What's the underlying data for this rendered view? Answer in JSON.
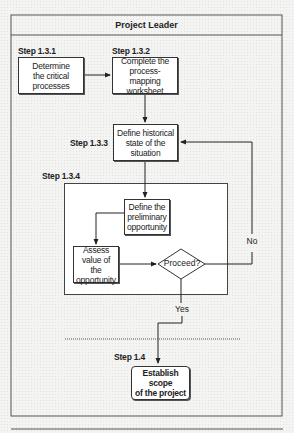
{
  "header": {
    "title": "Project Leader"
  },
  "steps": [
    {
      "id": "step-1-3-1",
      "label": "Step 1.3.1",
      "text": "Determine the critical processes",
      "lines": [
        "Determine",
        "the critical",
        "processes"
      ]
    },
    {
      "id": "step-1-3-2",
      "label": "Step 1.3.2",
      "text": "Complete the process-mapping worksheet",
      "lines": [
        "Complete the",
        "process-mapping",
        "worksheet"
      ]
    },
    {
      "id": "step-1-3-3",
      "label": "Step 1.3.3",
      "text": "Define historical state of the situation",
      "lines": [
        "Define historical",
        "state of the",
        "situation"
      ]
    },
    {
      "id": "step-1-3-4",
      "label": "Step 1.3.4",
      "substeps": [
        {
          "text": "Define the preliminary opportunity",
          "lines": [
            "Define the",
            "preliminary",
            "opportunity"
          ]
        },
        {
          "text": "Assess value of the opportunity",
          "lines": [
            "Assess",
            "value of the",
            "opportunity"
          ]
        }
      ],
      "decision": "Proceed?"
    },
    {
      "id": "step-1-4",
      "label": "Step 1.4",
      "text": "Establish scope of the project",
      "lines": [
        "Establish scope",
        "of the project"
      ]
    }
  ],
  "branches": {
    "no": "No",
    "yes": "Yes"
  },
  "colors": {
    "line": "#333333",
    "box_fill": "#ffffff",
    "background": "#f4f4f2"
  }
}
